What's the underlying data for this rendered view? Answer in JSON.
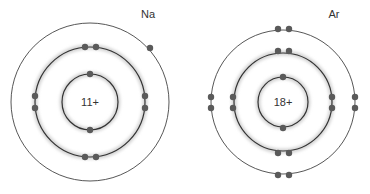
{
  "atoms": [
    {
      "symbol": "Na",
      "nucleus_charge": "11+",
      "center": [
        90,
        102
      ],
      "shells": [
        {
          "radius": 28,
          "electrons": 2
        },
        {
          "radius": 55,
          "electrons": 8
        },
        {
          "radius": 79,
          "electrons": 1
        }
      ]
    },
    {
      "symbol": "Ar",
      "nucleus_charge": "18+",
      "center": [
        283,
        102
      ],
      "shells": [
        {
          "radius": 25,
          "electrons": 2
        },
        {
          "radius": 49,
          "electrons": 8
        },
        {
          "radius": 72,
          "electrons": 8
        }
      ]
    }
  ],
  "colors": {
    "orbit": "#333333",
    "electron": "#5a5a5a",
    "glow": "#d8d8d8"
  }
}
